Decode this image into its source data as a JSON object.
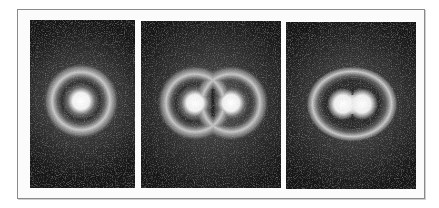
{
  "figure": {
    "frame": {
      "border_color": "#8a8a8a",
      "background": "#fbfbfb"
    },
    "panels": [
      {
        "id": "panel-1",
        "description": "single atom: bright core, dark nodal ring, bright outer ring",
        "x": 30,
        "y": 20,
        "w": 105,
        "h": 168,
        "cores": [
          {
            "cx": 51,
            "cy": 81,
            "r": 11
          }
        ],
        "rings": [
          {
            "cx": 51,
            "cy": 81,
            "rx": 30,
            "ry": 30
          }
        ]
      },
      {
        "id": "panel-2",
        "description": "two overlapping atoms, cores well separated",
        "x": 141,
        "y": 21,
        "w": 140,
        "h": 167,
        "cores": [
          {
            "cx": 54,
            "cy": 82,
            "r": 10
          },
          {
            "cx": 90,
            "cy": 82,
            "r": 10
          }
        ],
        "rings": [
          {
            "cx": 54,
            "cy": 82,
            "rx": 30,
            "ry": 30
          },
          {
            "cx": 90,
            "cy": 82,
            "rx": 30,
            "ry": 30
          }
        ]
      },
      {
        "id": "panel-3",
        "description": "two atoms closer together, merged outer ring",
        "x": 286,
        "y": 22,
        "w": 130,
        "h": 167,
        "cores": [
          {
            "cx": 57,
            "cy": 82,
            "r": 10
          },
          {
            "cx": 76,
            "cy": 82,
            "r": 10
          }
        ],
        "rings": [
          {
            "cx": 66,
            "cy": 82,
            "rx": 38,
            "ry": 31
          }
        ]
      }
    ],
    "colors": {
      "background_dark": "#1a1a1a",
      "glow": "#5a5a5a",
      "ring": "#cfcfcf",
      "node": "#2a2a2a",
      "core": "#ffffff"
    }
  }
}
